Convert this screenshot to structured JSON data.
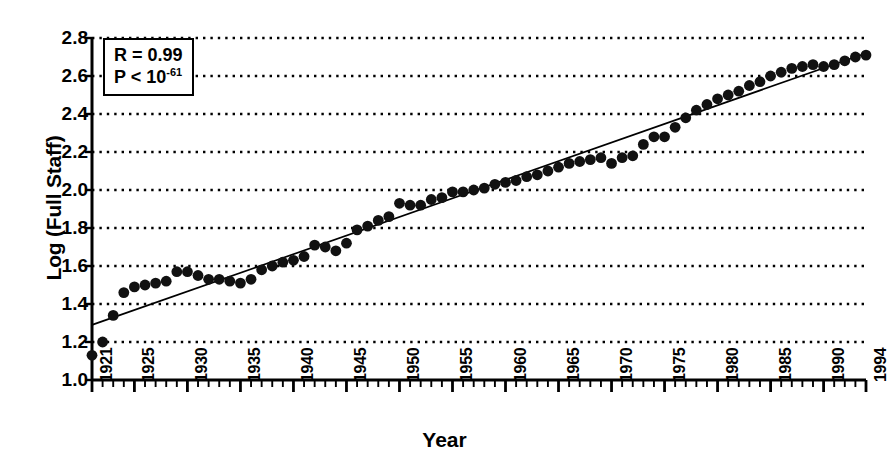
{
  "chart_data": {
    "type": "scatter",
    "title": "",
    "xlabel": "Year",
    "ylabel": "Log (Full Staff)",
    "xlim": [
      1921,
      1994
    ],
    "ylim": [
      1.0,
      2.8
    ],
    "grid": true,
    "legend": null,
    "y_ticks": [
      "2.8",
      "2.6",
      "2.4",
      "2.2",
      "2.0",
      "1.8",
      "1.6",
      "1.4",
      "1.2",
      "1.0"
    ],
    "y_tick_values": [
      2.8,
      2.6,
      2.4,
      2.2,
      2.0,
      1.8,
      1.6,
      1.4,
      1.2,
      1.0
    ],
    "x_ticks": [
      "1921",
      "1925",
      "1930",
      "1935",
      "1940",
      "1945",
      "1950",
      "1955",
      "1960",
      "1965",
      "1970",
      "1975",
      "1980",
      "1985",
      "1990",
      "1994"
    ],
    "x_tick_values": [
      1921,
      1925,
      1930,
      1935,
      1940,
      1945,
      1950,
      1955,
      1960,
      1965,
      1970,
      1975,
      1980,
      1985,
      1990,
      1994
    ],
    "minor_tick_interval": 1,
    "annotations": [
      {
        "line1": "R = 0.99",
        "line2_prefix": "P < 10",
        "line2_exponent": "-61"
      }
    ],
    "statistics": {
      "R": 0.99,
      "P_less_than": "10^-61"
    },
    "series": [
      {
        "name": "Full Staff (log10)",
        "marker": "filled-circle",
        "color": "#111111",
        "x": [
          1921,
          1922,
          1923,
          1924,
          1925,
          1926,
          1927,
          1928,
          1929,
          1930,
          1931,
          1932,
          1933,
          1934,
          1935,
          1936,
          1937,
          1938,
          1939,
          1940,
          1941,
          1942,
          1943,
          1944,
          1945,
          1946,
          1947,
          1948,
          1949,
          1950,
          1951,
          1952,
          1953,
          1954,
          1955,
          1956,
          1957,
          1958,
          1959,
          1960,
          1961,
          1962,
          1963,
          1964,
          1965,
          1966,
          1967,
          1968,
          1969,
          1970,
          1971,
          1972,
          1973,
          1974,
          1975,
          1976,
          1977,
          1978,
          1979,
          1980,
          1981,
          1982,
          1983,
          1984,
          1985,
          1986,
          1987,
          1988,
          1989,
          1990,
          1991,
          1992,
          1993,
          1994
        ],
        "y": [
          1.13,
          1.2,
          1.34,
          1.46,
          1.49,
          1.5,
          1.51,
          1.52,
          1.57,
          1.57,
          1.55,
          1.53,
          1.53,
          1.52,
          1.51,
          1.53,
          1.58,
          1.6,
          1.62,
          1.63,
          1.65,
          1.71,
          1.7,
          1.68,
          1.72,
          1.79,
          1.81,
          1.84,
          1.86,
          1.93,
          1.92,
          1.92,
          1.95,
          1.96,
          1.99,
          1.99,
          2.0,
          2.01,
          2.03,
          2.04,
          2.05,
          2.07,
          2.08,
          2.1,
          2.12,
          2.14,
          2.15,
          2.16,
          2.17,
          2.14,
          2.17,
          2.18,
          2.24,
          2.28,
          2.28,
          2.33,
          2.38,
          2.42,
          2.45,
          2.48,
          2.5,
          2.52,
          2.55,
          2.57,
          2.6,
          2.62,
          2.64,
          2.65,
          2.66,
          2.65,
          2.66,
          2.68,
          2.7,
          2.71
        ]
      }
    ],
    "fit_line": {
      "name": "linear regression",
      "color": "#000000",
      "x_start": 1921,
      "y_start": 1.29,
      "x_end": 1994,
      "y_end": 2.72
    }
  },
  "axis": {
    "ylabel": "Log (Full Staff)",
    "xlabel": "Year"
  }
}
